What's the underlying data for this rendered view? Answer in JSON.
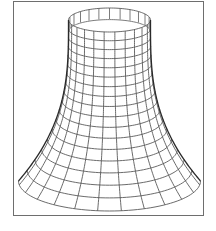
{
  "figure": {
    "frame": {
      "x": 13,
      "y": 1,
      "width": 191,
      "height": 215,
      "stroke": "#6e6e6e"
    },
    "mesh_color": "#5a5a5a",
    "silhouette_color": "#2a2a2a",
    "center_x": 109.5,
    "top": {
      "cy": 20,
      "rx": 41,
      "ry": 12
    },
    "bottom": {
      "cy": 181,
      "rx": 91,
      "ry": 30
    },
    "profile": "hyperbolic flare: radius grows slowly near top, rapidly near bottom",
    "rings": 17,
    "meridians": 24
  }
}
